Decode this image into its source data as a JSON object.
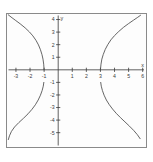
{
  "figure": {
    "background_color": "#ffffff",
    "frame_color": "#8a8a8a",
    "plot_background_color": "#fdfdfd",
    "axis_color": "#3a3a3a",
    "curve_color": "#4a4a4a"
  },
  "chart_data": {
    "type": "line",
    "title": "",
    "subtitle": "",
    "xlabel": "x",
    "ylabel": "y",
    "xlim": [
      -3.6,
      6.2
    ],
    "ylim": [
      -6.1,
      4.4
    ],
    "grid": false,
    "legend": null,
    "x_ticks": [
      -3,
      -2,
      -1,
      1,
      2,
      3,
      4,
      5,
      6
    ],
    "x_tick_labels": [
      "-3",
      "-2",
      "-1",
      "1",
      "2",
      "3",
      "4",
      "5",
      "6"
    ],
    "y_ticks": [
      4,
      3,
      2,
      1,
      -1,
      -2,
      -3,
      -4,
      -5
    ],
    "y_tick_labels": [
      "4",
      "3",
      "2",
      "1",
      "-1",
      "-2",
      "-3",
      "-4",
      "-5"
    ],
    "vertices": [
      {
        "x": -1,
        "y": 0
      },
      {
        "x": 3,
        "y": 0
      }
    ],
    "series": [
      {
        "name": "upper-left-branch",
        "points": [
          [
            -1.0,
            0.0
          ],
          [
            -1.03,
            0.45
          ],
          [
            -1.08,
            0.85
          ],
          [
            -1.15,
            1.2
          ],
          [
            -1.26,
            1.6
          ],
          [
            -1.4,
            1.98
          ],
          [
            -1.58,
            2.35
          ],
          [
            -1.8,
            2.7
          ],
          [
            -2.05,
            3.02
          ],
          [
            -2.35,
            3.34
          ],
          [
            -2.7,
            3.66
          ],
          [
            -3.05,
            3.95
          ],
          [
            -3.35,
            4.2
          ],
          [
            -3.55,
            4.38
          ]
        ]
      },
      {
        "name": "upper-right-branch",
        "points": [
          [
            3.0,
            0.0
          ],
          [
            3.04,
            0.45
          ],
          [
            3.1,
            0.85
          ],
          [
            3.2,
            1.22
          ],
          [
            3.34,
            1.62
          ],
          [
            3.52,
            2.0
          ],
          [
            3.74,
            2.38
          ],
          [
            4.0,
            2.72
          ],
          [
            4.3,
            3.05
          ],
          [
            4.64,
            3.38
          ],
          [
            5.0,
            3.68
          ],
          [
            5.35,
            3.95
          ],
          [
            5.65,
            4.18
          ],
          [
            5.85,
            4.34
          ]
        ]
      },
      {
        "name": "lower-left-branch",
        "points": [
          [
            -1.02,
            -1.0
          ],
          [
            -1.06,
            -1.3
          ],
          [
            -1.14,
            -1.65
          ],
          [
            -1.26,
            -2.02
          ],
          [
            -1.42,
            -2.4
          ],
          [
            -1.62,
            -2.78
          ],
          [
            -1.86,
            -3.14
          ],
          [
            -2.14,
            -3.5
          ],
          [
            -2.46,
            -3.85
          ],
          [
            -2.8,
            -4.2
          ],
          [
            -3.1,
            -4.55
          ],
          [
            -3.32,
            -4.9
          ],
          [
            -3.46,
            -5.25
          ],
          [
            -3.54,
            -5.55
          ]
        ]
      },
      {
        "name": "lower-right-branch",
        "points": [
          [
            3.02,
            -1.0
          ],
          [
            3.06,
            -1.3
          ],
          [
            3.14,
            -1.65
          ],
          [
            3.26,
            -2.02
          ],
          [
            3.42,
            -2.4
          ],
          [
            3.62,
            -2.76
          ],
          [
            3.86,
            -3.12
          ],
          [
            4.12,
            -3.46
          ],
          [
            4.42,
            -3.8
          ],
          [
            4.74,
            -4.14
          ],
          [
            5.06,
            -4.48
          ],
          [
            5.36,
            -4.82
          ],
          [
            5.62,
            -5.16
          ],
          [
            5.82,
            -5.48
          ]
        ]
      }
    ]
  }
}
